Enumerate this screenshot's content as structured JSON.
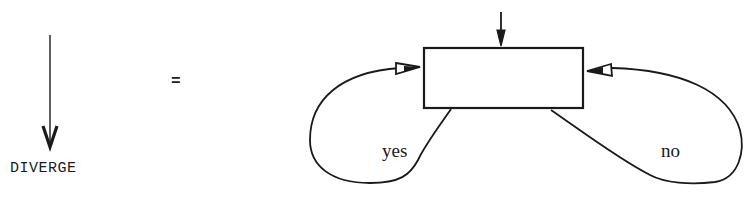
{
  "diagram": {
    "left_symbol": {
      "label": "DIVERGE",
      "type": "downward-arrow"
    },
    "equals_sign": "=",
    "flowchart": {
      "node": {
        "shape": "rectangle",
        "text": ""
      },
      "entry": "incoming-arrow-top",
      "loops": [
        {
          "id": "yes-loop",
          "label": "yes",
          "from": "box-bottom-left",
          "to": "box-left-side"
        },
        {
          "id": "no-loop",
          "label": "no",
          "from": "box-bottom-right",
          "to": "box-right-side"
        }
      ]
    },
    "colors": {
      "stroke": "#1a1a1a",
      "background": "#ffffff"
    }
  }
}
